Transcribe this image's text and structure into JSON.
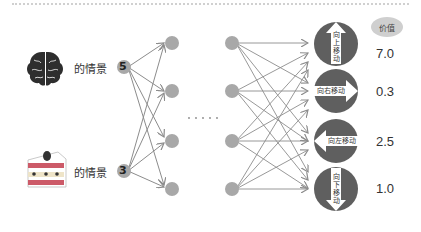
{
  "inputs": [
    {
      "icon": "brain-icon",
      "label": "的情景",
      "value": "5"
    },
    {
      "icon": "cake-icon",
      "label": "的情景",
      "value": "3"
    }
  ],
  "ellipsis": "· · · · ·",
  "outputs": [
    {
      "action": "向上移动",
      "direction": "up",
      "value": "7.0"
    },
    {
      "action": "向右移动",
      "direction": "right",
      "value": "0.3"
    },
    {
      "action": "向左移动",
      "direction": "left",
      "value": "2.5"
    },
    {
      "action": "向下移动",
      "direction": "down",
      "value": "1.0"
    }
  ],
  "value_header": "价值",
  "colors": {
    "node": "#a8a8a8",
    "edge": "#8c8c8c",
    "output_circle": "#5f5f5f",
    "arrow_fill": "#ffffff"
  }
}
